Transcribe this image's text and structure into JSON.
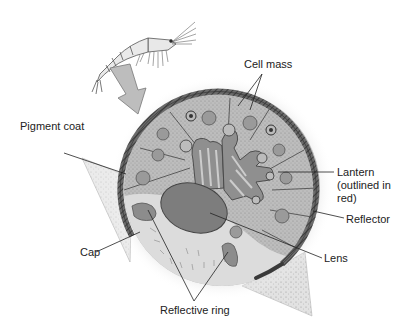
{
  "figure": {
    "labels": {
      "cell_mass": "Cell mass",
      "pigment_coat": "Pigment coat",
      "lantern_line1": "Lantern",
      "lantern_line2": "(outlined in",
      "lantern_line3": "red)",
      "reflector": "Reflector",
      "cap": "Cap",
      "lens": "Lens",
      "reflective_ring": "Reflective ring"
    },
    "icons": {
      "organism": "krill-illustration",
      "pointer": "zoom-arrow"
    },
    "colors": {
      "background": "#ffffff",
      "pigment_coat": "#555555",
      "cell_fill": "#bdbdbd",
      "lantern_fill": "#8f8f8f",
      "lens_fill": "#7d7d7d",
      "cap_fill": "#dedede",
      "shadow": "#cfcfcf",
      "text": "#222222"
    }
  }
}
